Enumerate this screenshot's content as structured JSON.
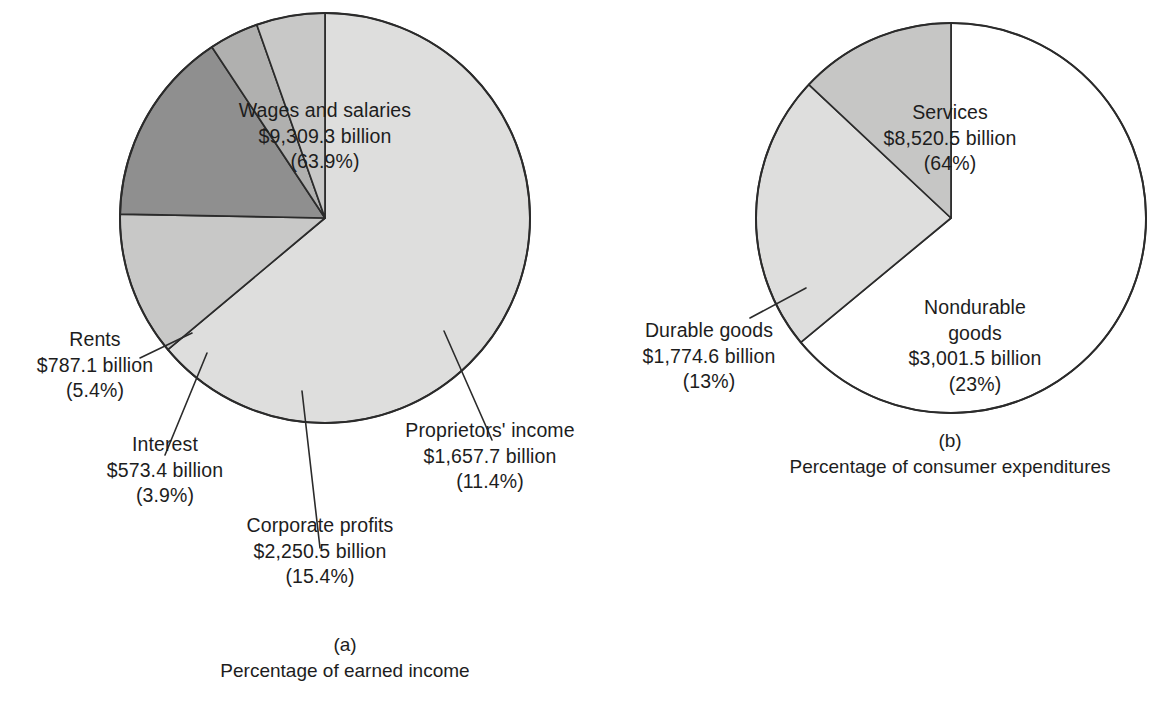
{
  "figure": {
    "background": "#ffffff",
    "text_color": "#1d1d1d",
    "stroke_color": "#2b2b2b"
  },
  "chart_data": [
    {
      "type": "pie",
      "id": "earned-income",
      "title": "Percentage of earned income",
      "panel_tag": "(a)",
      "center": [
        325,
        218
      ],
      "radius": 205,
      "start_angle_deg": -90,
      "direction": "clockwise",
      "categories": [
        "Wages and salaries",
        "Proprietors' income",
        "Corporate profits",
        "Interest",
        "Rents"
      ],
      "values": [
        63.9,
        11.4,
        15.4,
        3.9,
        5.4
      ],
      "amounts_billions": [
        9309.3,
        1657.7,
        2250.5,
        573.4,
        787.1
      ],
      "slice_colors": [
        "#dededd",
        "#c8c8c7",
        "#8f8f8f",
        "#b0b0af",
        "#c8c8c7"
      ],
      "slices": [
        {
          "name": "Wages and salaries",
          "amount": "$9,309.3 billion",
          "percent": "(63.9%)",
          "value": 63.9,
          "color": "#dededd",
          "label_placement": "inside"
        },
        {
          "name": "Proprietors' income",
          "amount": "$1,657.7 billion",
          "percent": "(11.4%)",
          "value": 11.4,
          "color": "#c8c8c7",
          "label_placement": "outside-right"
        },
        {
          "name": "Corporate profits",
          "amount": "$2,250.5 billion",
          "percent": "(15.4%)",
          "value": 15.4,
          "color": "#8f8f8f",
          "label_placement": "outside-bottom"
        },
        {
          "name": "Interest",
          "amount": "$573.4 billion",
          "percent": "(3.9%)",
          "value": 3.9,
          "color": "#b0b0af",
          "label_placement": "outside-left"
        },
        {
          "name": "Rents",
          "amount": "$787.1 billion",
          "percent": "(5.4%)",
          "value": 5.4,
          "color": "#c8c8c7",
          "label_placement": "outside-left"
        }
      ]
    },
    {
      "type": "pie",
      "id": "consumer-expenditures",
      "title": "Percentage of consumer expenditures",
      "panel_tag": "(b)",
      "center": [
        951,
        218
      ],
      "radius": 195,
      "start_angle_deg": -90,
      "direction": "clockwise",
      "categories": [
        "Services",
        "Nondurable goods",
        "Durable goods"
      ],
      "values": [
        64,
        23,
        13
      ],
      "amounts_billions": [
        8520.5,
        3001.5,
        1774.6
      ],
      "slice_colors": [
        "#ffffff",
        "#dededd",
        "#c6c6c5"
      ],
      "slices": [
        {
          "name": "Services",
          "amount": "$8,520.5 billion",
          "percent": "(64%)",
          "value": 64,
          "color": "#ffffff",
          "label_placement": "inside"
        },
        {
          "name": "Nondurable goods",
          "amount": "$3,001.5 billion",
          "percent": "(23%)",
          "value": 23,
          "color": "#dededd",
          "label_placement": "inside"
        },
        {
          "name": "Durable goods",
          "amount": "$1,774.6 billion",
          "percent": "(13%)",
          "value": 13,
          "color": "#c6c6c5",
          "label_placement": "outside-left"
        }
      ]
    }
  ],
  "labels": {
    "wages": {
      "name": "Wages and salaries",
      "amount": "$9,309.3 billion",
      "percent": "(63.9%)"
    },
    "rents": {
      "name": "Rents",
      "amount": "$787.1 billion",
      "percent": "(5.4%)"
    },
    "interest": {
      "name": "Interest",
      "amount": "$573.4 billion",
      "percent": "(3.9%)"
    },
    "corporate_profits": {
      "name": "Corporate profits",
      "amount": "$2,250.5 billion",
      "percent": "(15.4%)"
    },
    "proprietors_income": {
      "name": "Proprietors' income",
      "amount": "$1,657.7 billion",
      "percent": "(11.4%)"
    },
    "services": {
      "name": "Services",
      "amount": "$8,520.5 billion",
      "percent": "(64%)"
    },
    "durable_goods": {
      "name": "Durable goods",
      "amount": "$1,774.6 billion",
      "percent": "(13%)"
    },
    "nondurable_goods": {
      "name_line1": "Nondurable",
      "name_line2": "goods",
      "amount": "$3,001.5 billion",
      "percent": "(23%)"
    }
  },
  "captions": {
    "a": {
      "tag": "(a)",
      "text": "Percentage of earned income"
    },
    "b": {
      "tag": "(b)",
      "text": "Percentage of consumer expenditures"
    }
  }
}
